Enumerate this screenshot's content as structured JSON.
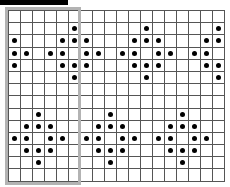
{
  "title_bar": {
    "color": "#000000"
  },
  "board": {
    "rows": 14,
    "cols": 18,
    "grid_line_color": "#555555",
    "dot_color": "#000000",
    "filled": {
      "1": [
        5,
        11,
        17
      ],
      "2": [
        0,
        4,
        5,
        6,
        10,
        11,
        12,
        16,
        17
      ],
      "3": [
        0,
        1,
        3,
        4,
        6,
        7,
        9,
        10,
        12,
        13,
        15,
        16
      ],
      "4": [
        0,
        4,
        5,
        6,
        10,
        11,
        12,
        16,
        17
      ],
      "5": [
        5,
        11,
        17
      ],
      "8": [
        2,
        8,
        14
      ],
      "9": [
        1,
        2,
        3,
        7,
        8,
        9,
        13,
        14,
        15
      ],
      "10": [
        0,
        1,
        3,
        4,
        6,
        7,
        9,
        10,
        12,
        13,
        15,
        16
      ],
      "11": [
        1,
        2,
        3,
        7,
        8,
        9,
        13,
        14,
        15
      ],
      "12": [
        2,
        8,
        14
      ]
    }
  },
  "selection": {
    "col_start": 0,
    "col_end": 5,
    "row_start": 0,
    "row_end": 13,
    "border_color": "#b3b3b3"
  }
}
